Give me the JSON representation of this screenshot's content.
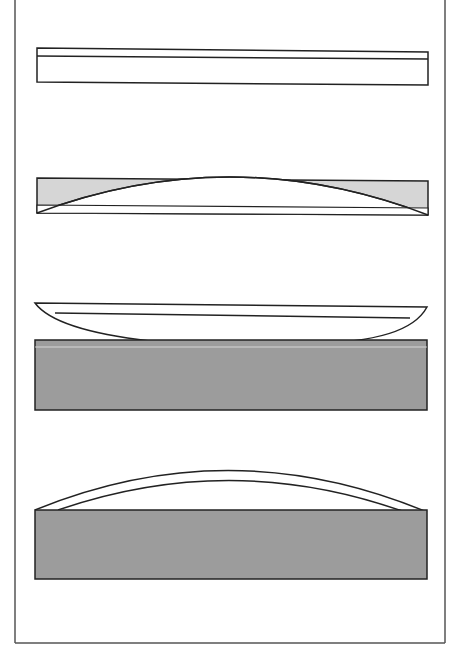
{
  "diagram": {
    "colors": {
      "background": "#ffffff",
      "frame": "#555555",
      "outline": "#222222",
      "light_fill": "#d6d6d6",
      "dark_fill": "#9c9c9c",
      "white_fill": "#ffffff"
    },
    "panels": [
      {
        "id": "panel-1",
        "description": "flat plate with thin top layer"
      },
      {
        "id": "panel-2",
        "description": "plate with convex lens shape, shaded corners"
      },
      {
        "id": "panel-3",
        "description": "curved lens resting on shaded block"
      },
      {
        "id": "panel-4",
        "description": "arched dome over shaded block"
      }
    ]
  }
}
